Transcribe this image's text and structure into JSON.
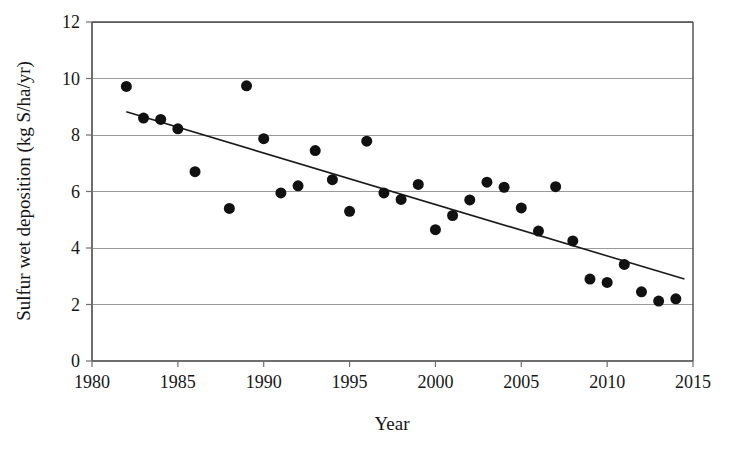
{
  "chart_data": {
    "type": "scatter",
    "title": "",
    "xlabel": "Year",
    "ylabel": "Sulfur wet deposition (kg S/ha/yr)",
    "xlim": [
      1980,
      2015
    ],
    "ylim": [
      0,
      12
    ],
    "xticks": [
      1980,
      1985,
      1990,
      1995,
      2000,
      2005,
      2010,
      2015
    ],
    "yticks": [
      0,
      2,
      4,
      6,
      8,
      10,
      12
    ],
    "xtick_labels": [
      "1980",
      "1985",
      "1990",
      "1995",
      "2000",
      "2005",
      "2010",
      "2015"
    ],
    "ytick_labels": [
      "0",
      "2",
      "4",
      "6",
      "8",
      "10",
      "12"
    ],
    "grid": "horizontal",
    "legend": "none",
    "marker": {
      "shape": "circle",
      "color": "#111111",
      "size_px": 11
    },
    "series": [
      {
        "name": "Sulfur wet deposition",
        "x": [
          1982,
          1983,
          1984,
          1985,
          1986,
          1988,
          1989,
          1990,
          1991,
          1992,
          1993,
          1994,
          1995,
          1996,
          1997,
          1998,
          1999,
          2000,
          2001,
          2002,
          2003,
          2004,
          2005,
          2006,
          2007,
          2008,
          2009,
          2010,
          2011,
          2012,
          2013,
          2014
        ],
        "y": [
          9.72,
          8.6,
          8.55,
          8.22,
          6.7,
          5.4,
          9.74,
          7.87,
          5.95,
          6.2,
          7.45,
          6.42,
          5.3,
          7.78,
          5.95,
          5.72,
          6.25,
          4.65,
          5.15,
          5.7,
          6.33,
          6.15,
          5.42,
          4.6,
          6.17,
          4.25,
          2.9,
          2.78,
          3.42,
          2.45,
          2.12,
          2.2
        ]
      }
    ],
    "trendline": {
      "type": "linear",
      "x_start": 1982.0,
      "y_start": 8.82,
      "x_end": 2014.5,
      "y_end": 2.9,
      "color": "#1a1a1a",
      "width_px": 1.6
    }
  },
  "axes": {
    "y_axis_title": "Sulfur wet deposition (kg S/ha/yr)",
    "x_axis_title": "Year"
  }
}
